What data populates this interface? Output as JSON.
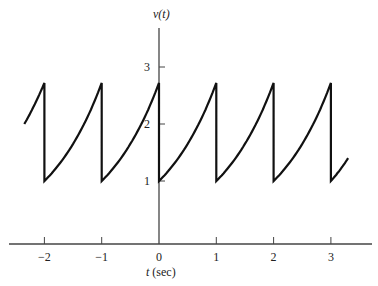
{
  "chart_data": {
    "type": "line",
    "title": "",
    "xlabel": "t (sec)",
    "ylabel": "v(t)",
    "xlabel_var": "t",
    "xlabel_unit": "(sec)",
    "x_ticks": [
      -2,
      -1,
      0,
      1,
      2,
      3
    ],
    "x_tick_labels": [
      "−2",
      "−1",
      "0",
      "1",
      "2",
      "3"
    ],
    "y_ticks": [
      1,
      2,
      3
    ],
    "y_tick_labels": [
      "1",
      "2",
      "3"
    ],
    "xlim": [
      -2.5,
      3.7
    ],
    "ylim": [
      0,
      3.7
    ],
    "grid": false,
    "legend": null,
    "series": [
      {
        "name": "v(t)",
        "description": "Periodic exponential sawtooth, period 1 s: rises exponentially from 1 to e (~2.72) then drops instantly back to 1 at each integer t",
        "period": 1,
        "min": 1,
        "max": 2.72,
        "points": [
          [
            -2.35,
            2.0
          ],
          [
            -2.0,
            2.72
          ],
          [
            -2.0,
            1.0
          ],
          [
            -1.5,
            1.65
          ],
          [
            -1.0,
            2.72
          ],
          [
            -1.0,
            1.0
          ],
          [
            -0.5,
            1.65
          ],
          [
            0.0,
            2.72
          ],
          [
            0.0,
            1.0
          ],
          [
            0.5,
            1.65
          ],
          [
            1.0,
            2.72
          ],
          [
            1.0,
            1.0
          ],
          [
            1.5,
            1.65
          ],
          [
            2.0,
            2.72
          ],
          [
            2.0,
            1.0
          ],
          [
            2.5,
            1.65
          ],
          [
            3.0,
            2.72
          ],
          [
            3.0,
            1.0
          ],
          [
            3.3,
            1.4
          ]
        ]
      }
    ]
  }
}
